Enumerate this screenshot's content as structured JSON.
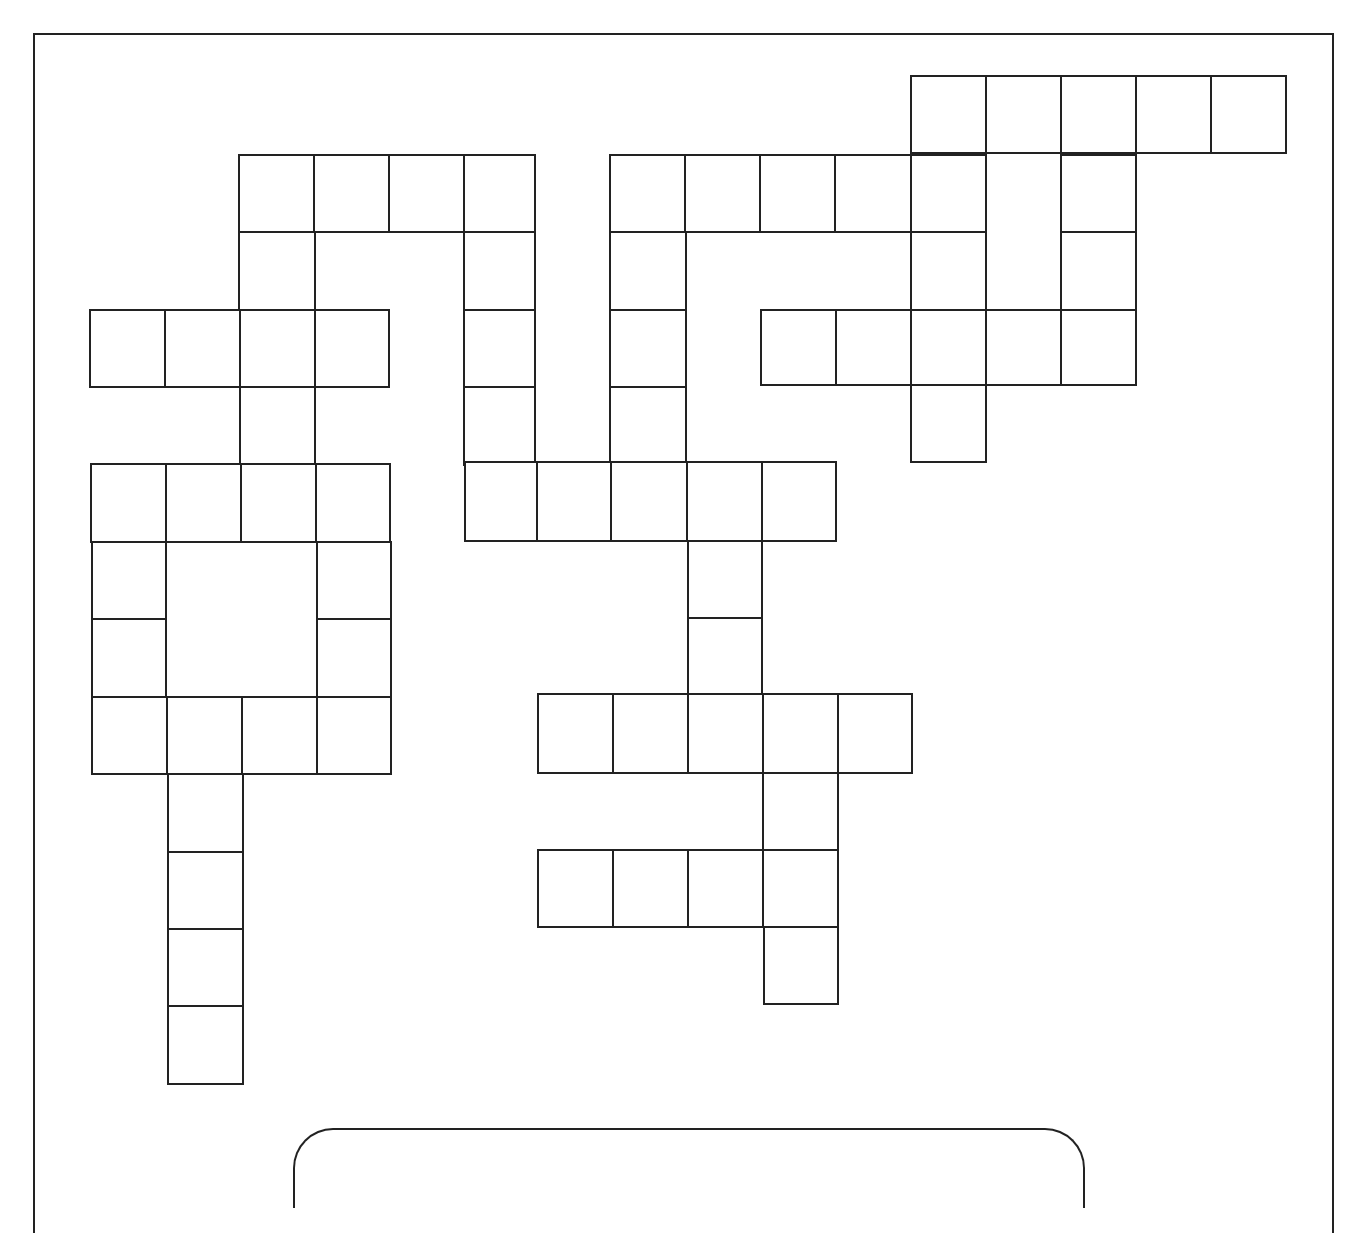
{
  "puzzle": {
    "type": "crossword",
    "border_color": "#222222",
    "background": "#ffffff",
    "cells": [
      {
        "x": 910,
        "y": 75,
        "w": 77,
        "h": 79
      },
      {
        "x": 985,
        "y": 75,
        "w": 77,
        "h": 79
      },
      {
        "x": 1060,
        "y": 75,
        "w": 77,
        "h": 79
      },
      {
        "x": 1135,
        "y": 75,
        "w": 77,
        "h": 79
      },
      {
        "x": 1210,
        "y": 75,
        "w": 77,
        "h": 79
      },
      {
        "x": 238,
        "y": 154,
        "w": 78,
        "h": 79
      },
      {
        "x": 313,
        "y": 154,
        "w": 77,
        "h": 79
      },
      {
        "x": 388,
        "y": 154,
        "w": 77,
        "h": 79
      },
      {
        "x": 463,
        "y": 154,
        "w": 73,
        "h": 79
      },
      {
        "x": 609,
        "y": 154,
        "w": 78,
        "h": 79
      },
      {
        "x": 684,
        "y": 154,
        "w": 77,
        "h": 79
      },
      {
        "x": 759,
        "y": 154,
        "w": 77,
        "h": 79
      },
      {
        "x": 834,
        "y": 154,
        "w": 78,
        "h": 79
      },
      {
        "x": 910,
        "y": 154,
        "w": 77,
        "h": 79
      },
      {
        "x": 1060,
        "y": 154,
        "w": 77,
        "h": 79
      },
      {
        "x": 238,
        "y": 231,
        "w": 78,
        "h": 80
      },
      {
        "x": 463,
        "y": 231,
        "w": 73,
        "h": 80
      },
      {
        "x": 609,
        "y": 231,
        "w": 78,
        "h": 80
      },
      {
        "x": 910,
        "y": 231,
        "w": 77,
        "h": 80
      },
      {
        "x": 1060,
        "y": 231,
        "w": 77,
        "h": 80
      },
      {
        "x": 89,
        "y": 309,
        "w": 77,
        "h": 79
      },
      {
        "x": 164,
        "y": 309,
        "w": 77,
        "h": 79
      },
      {
        "x": 239,
        "y": 309,
        "w": 77,
        "h": 79
      },
      {
        "x": 314,
        "y": 309,
        "w": 76,
        "h": 79
      },
      {
        "x": 463,
        "y": 309,
        "w": 73,
        "h": 79
      },
      {
        "x": 609,
        "y": 309,
        "w": 78,
        "h": 79
      },
      {
        "x": 760,
        "y": 309,
        "w": 77,
        "h": 77
      },
      {
        "x": 835,
        "y": 309,
        "w": 77,
        "h": 77
      },
      {
        "x": 910,
        "y": 309,
        "w": 77,
        "h": 77
      },
      {
        "x": 985,
        "y": 309,
        "w": 77,
        "h": 77
      },
      {
        "x": 1060,
        "y": 309,
        "w": 77,
        "h": 77
      },
      {
        "x": 239,
        "y": 386,
        "w": 77,
        "h": 80
      },
      {
        "x": 463,
        "y": 386,
        "w": 73,
        "h": 80
      },
      {
        "x": 609,
        "y": 386,
        "w": 78,
        "h": 80
      },
      {
        "x": 910,
        "y": 384,
        "w": 77,
        "h": 79
      },
      {
        "x": 90,
        "y": 463,
        "w": 77,
        "h": 80
      },
      {
        "x": 165,
        "y": 463,
        "w": 77,
        "h": 80
      },
      {
        "x": 240,
        "y": 463,
        "w": 77,
        "h": 80
      },
      {
        "x": 315,
        "y": 463,
        "w": 76,
        "h": 80
      },
      {
        "x": 464,
        "y": 461,
        "w": 75,
        "h": 81
      },
      {
        "x": 536,
        "y": 461,
        "w": 76,
        "h": 81
      },
      {
        "x": 610,
        "y": 461,
        "w": 78,
        "h": 81
      },
      {
        "x": 686,
        "y": 461,
        "w": 77,
        "h": 81
      },
      {
        "x": 761,
        "y": 461,
        "w": 76,
        "h": 81
      },
      {
        "x": 91,
        "y": 541,
        "w": 76,
        "h": 79
      },
      {
        "x": 316,
        "y": 541,
        "w": 76,
        "h": 79
      },
      {
        "x": 687,
        "y": 540,
        "w": 76,
        "h": 79
      },
      {
        "x": 91,
        "y": 618,
        "w": 76,
        "h": 80
      },
      {
        "x": 316,
        "y": 618,
        "w": 76,
        "h": 80
      },
      {
        "x": 687,
        "y": 617,
        "w": 76,
        "h": 79
      },
      {
        "x": 91,
        "y": 696,
        "w": 77,
        "h": 79
      },
      {
        "x": 166,
        "y": 696,
        "w": 77,
        "h": 79
      },
      {
        "x": 241,
        "y": 696,
        "w": 77,
        "h": 79
      },
      {
        "x": 316,
        "y": 696,
        "w": 76,
        "h": 79
      },
      {
        "x": 537,
        "y": 693,
        "w": 77,
        "h": 81
      },
      {
        "x": 612,
        "y": 693,
        "w": 77,
        "h": 81
      },
      {
        "x": 687,
        "y": 693,
        "w": 77,
        "h": 81
      },
      {
        "x": 762,
        "y": 693,
        "w": 77,
        "h": 81
      },
      {
        "x": 837,
        "y": 693,
        "w": 76,
        "h": 81
      },
      {
        "x": 167,
        "y": 773,
        "w": 77,
        "h": 80
      },
      {
        "x": 762,
        "y": 772,
        "w": 77,
        "h": 79
      },
      {
        "x": 167,
        "y": 851,
        "w": 77,
        "h": 79
      },
      {
        "x": 537,
        "y": 849,
        "w": 77,
        "h": 79
      },
      {
        "x": 612,
        "y": 849,
        "w": 77,
        "h": 79
      },
      {
        "x": 687,
        "y": 849,
        "w": 77,
        "h": 79
      },
      {
        "x": 762,
        "y": 849,
        "w": 77,
        "h": 79
      },
      {
        "x": 167,
        "y": 928,
        "w": 77,
        "h": 79
      },
      {
        "x": 763,
        "y": 926,
        "w": 76,
        "h": 79
      },
      {
        "x": 167,
        "y": 1005,
        "w": 77,
        "h": 80
      }
    ]
  },
  "clue_box": {
    "label": ""
  }
}
